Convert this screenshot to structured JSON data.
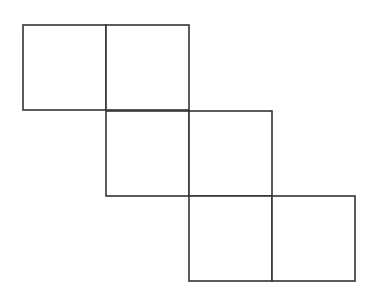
{
  "diagram": {
    "type": "cube-net",
    "stroke_color": "#333333",
    "fill_color": "#ffffff",
    "squares": [
      {
        "row": 0,
        "col": 0,
        "x": 23,
        "y": 25,
        "size": 83
      },
      {
        "row": 0,
        "col": 1,
        "x": 106,
        "y": 25,
        "size": 83
      },
      {
        "row": 1,
        "col": 1,
        "x": 106,
        "y": 111,
        "size": 83
      },
      {
        "row": 1,
        "col": 2,
        "x": 189,
        "y": 111,
        "size": 83
      },
      {
        "row": 2,
        "col": 2,
        "x": 189,
        "y": 196,
        "size": 83
      },
      {
        "row": 2,
        "col": 3,
        "x": 272,
        "y": 196,
        "size": 83
      }
    ]
  }
}
